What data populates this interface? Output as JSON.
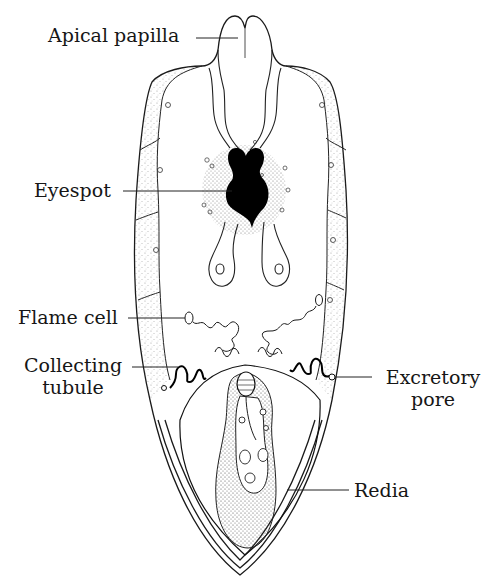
{
  "figure": {
    "colors": {
      "ink": "#161616",
      "background": "#ffffff",
      "eyespot": "#000000",
      "stipple": "#555555"
    },
    "labels": [
      {
        "id": "apical-papilla",
        "text": "Apical papilla",
        "side": "left"
      },
      {
        "id": "eyespot",
        "text": "Eyespot",
        "side": "left"
      },
      {
        "id": "flame-cell",
        "text": "Flame cell",
        "side": "left"
      },
      {
        "id": "collecting-tubule",
        "lines": [
          "Collecting",
          "tubule"
        ],
        "side": "left"
      },
      {
        "id": "excretory-pore",
        "lines": [
          "Excretory",
          "pore"
        ],
        "side": "right"
      },
      {
        "id": "redia",
        "text": "Redia",
        "side": "right"
      }
    ]
  }
}
